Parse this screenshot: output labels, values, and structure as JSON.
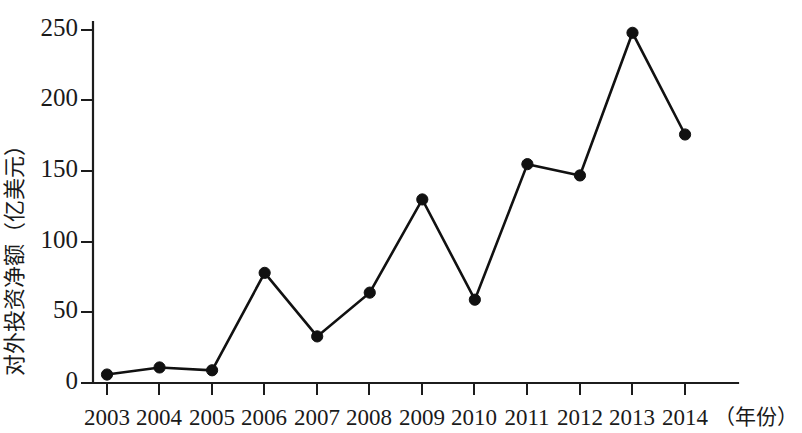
{
  "chart_data": {
    "type": "line",
    "title": "",
    "subtitle": "",
    "xlabel": "（年份）",
    "ylabel": "对外投资净额（亿美元）",
    "categories": [
      "2003",
      "2004",
      "2005",
      "2006",
      "2007",
      "2008",
      "2009",
      "2010",
      "2011",
      "2012",
      "2013",
      "2014"
    ],
    "values": [
      6,
      11,
      9,
      78,
      33,
      64,
      130,
      59,
      155,
      147,
      248,
      176
    ],
    "series": [
      {
        "name": "对外投资净额",
        "values": [
          6,
          11,
          9,
          78,
          33,
          64,
          130,
          59,
          155,
          147,
          248,
          176
        ]
      }
    ],
    "ylim": [
      0,
      250
    ],
    "yticks": [
      0,
      50,
      100,
      150,
      200,
      250
    ],
    "ytick_labels": [
      "0",
      "50",
      "100",
      "150",
      "200",
      "250"
    ],
    "xtick_labels": [
      "2003",
      "2004",
      "2005",
      "2006",
      "2007",
      "2008",
      "2009",
      "2010",
      "2011",
      "2012",
      "2013",
      "2014"
    ],
    "grid": false,
    "legend": false,
    "legend_position": "none",
    "marker": "filled-circle",
    "line_color": "#111111",
    "marker_color": "#111111",
    "axis_color": "#1c1c1c",
    "background_color": "#ffffff",
    "annotations": []
  },
  "axes": {
    "y_axis_title": "对外投资净额（亿美元）",
    "x_axis_unit_label": "（年份）"
  }
}
